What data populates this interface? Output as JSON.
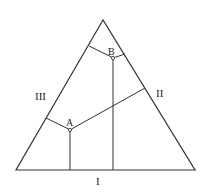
{
  "diagram": {
    "type": "ternary-triangle",
    "stroke_color": "#333333",
    "background": "#ffffff",
    "triangle": {
      "apex": [
        103,
        20
      ],
      "left": [
        16,
        170
      ],
      "right": [
        195,
        170
      ]
    },
    "labels": {
      "side_bottom": "I",
      "side_right": "II",
      "side_left": "III",
      "point_a": "A",
      "point_b": "B"
    },
    "points": {
      "A": [
        70,
        130
      ],
      "B": [
        113,
        58
      ]
    },
    "segments": {
      "A_to_base": [
        [
          70,
          130
        ],
        [
          70,
          170
        ]
      ],
      "A_to_left": [
        [
          70,
          130
        ],
        [
          46,
          118
        ]
      ],
      "A_to_right": [
        [
          70,
          130
        ],
        [
          145,
          88
        ]
      ],
      "B_to_base": [
        [
          113,
          58
        ],
        [
          113,
          170
        ]
      ],
      "B_to_left": [
        [
          113,
          58
        ],
        [
          89,
          46
        ]
      ],
      "B_to_right": [
        [
          113,
          58
        ],
        [
          125,
          54
        ]
      ]
    }
  }
}
